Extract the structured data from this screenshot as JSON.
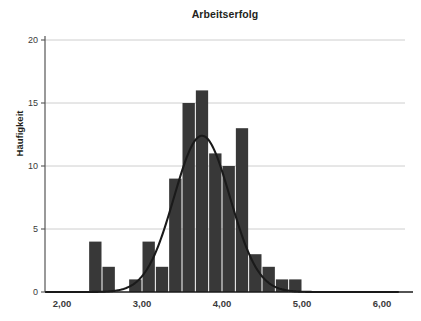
{
  "chart_data": {
    "type": "bar",
    "title": "Arbeitserfolg",
    "xlabel": "",
    "ylabel": "Häufigkeit",
    "grid": true,
    "legend": "none",
    "bar_color": "#383838",
    "curve_color": "#1a1a1a",
    "grid_color": "#c8c8c8",
    "axis_color": "#555555",
    "background": "#ffffff",
    "xlim": [
      1.8,
      6.2
    ],
    "ylim": [
      0,
      20
    ],
    "bin_width": 0.1667,
    "xticks": [
      2,
      3,
      4,
      5,
      6
    ],
    "xtick_labels": [
      "2,00",
      "3,00",
      "4,00",
      "5,00",
      "6,00"
    ],
    "yticks": [
      0,
      5,
      10,
      15,
      20
    ],
    "ytick_labels": [
      "0",
      "5",
      "10",
      "15",
      "20"
    ],
    "bins": [
      {
        "center": 2.417,
        "left": 2.333,
        "right": 2.5,
        "value": 4
      },
      {
        "center": 2.583,
        "left": 2.5,
        "right": 2.667,
        "value": 2
      },
      {
        "center": 2.75,
        "left": 2.667,
        "right": 2.833,
        "value": 0
      },
      {
        "center": 2.917,
        "left": 2.833,
        "right": 3.0,
        "value": 1
      },
      {
        "center": 3.083,
        "left": 3.0,
        "right": 3.167,
        "value": 4
      },
      {
        "center": 3.25,
        "left": 3.167,
        "right": 3.333,
        "value": 2
      },
      {
        "center": 3.417,
        "left": 3.333,
        "right": 3.5,
        "value": 9
      },
      {
        "center": 3.583,
        "left": 3.5,
        "right": 3.667,
        "value": 15
      },
      {
        "center": 3.75,
        "left": 3.667,
        "right": 3.833,
        "value": 16
      },
      {
        "center": 3.917,
        "left": 3.833,
        "right": 4.0,
        "value": 11
      },
      {
        "center": 4.083,
        "left": 4.0,
        "right": 4.167,
        "value": 10
      },
      {
        "center": 4.25,
        "left": 4.167,
        "right": 4.333,
        "value": 13
      },
      {
        "center": 4.417,
        "left": 4.333,
        "right": 4.5,
        "value": 3
      },
      {
        "center": 4.583,
        "left": 4.5,
        "right": 4.667,
        "value": 2
      },
      {
        "center": 4.75,
        "left": 4.667,
        "right": 4.833,
        "value": 1
      },
      {
        "center": 4.917,
        "left": 4.833,
        "right": 5.0,
        "value": 1
      }
    ],
    "normal_curve": {
      "description": "Normalverteilungskurve",
      "mean": 3.75,
      "std_dev": 0.35,
      "peak_value": 12.4
    }
  }
}
